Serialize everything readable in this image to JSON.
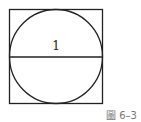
{
  "figure": {
    "caption": "圖 6–3",
    "diameter_label": "1",
    "shapes": [
      "square",
      "inscribed-circle",
      "horizontal-diameter"
    ]
  }
}
